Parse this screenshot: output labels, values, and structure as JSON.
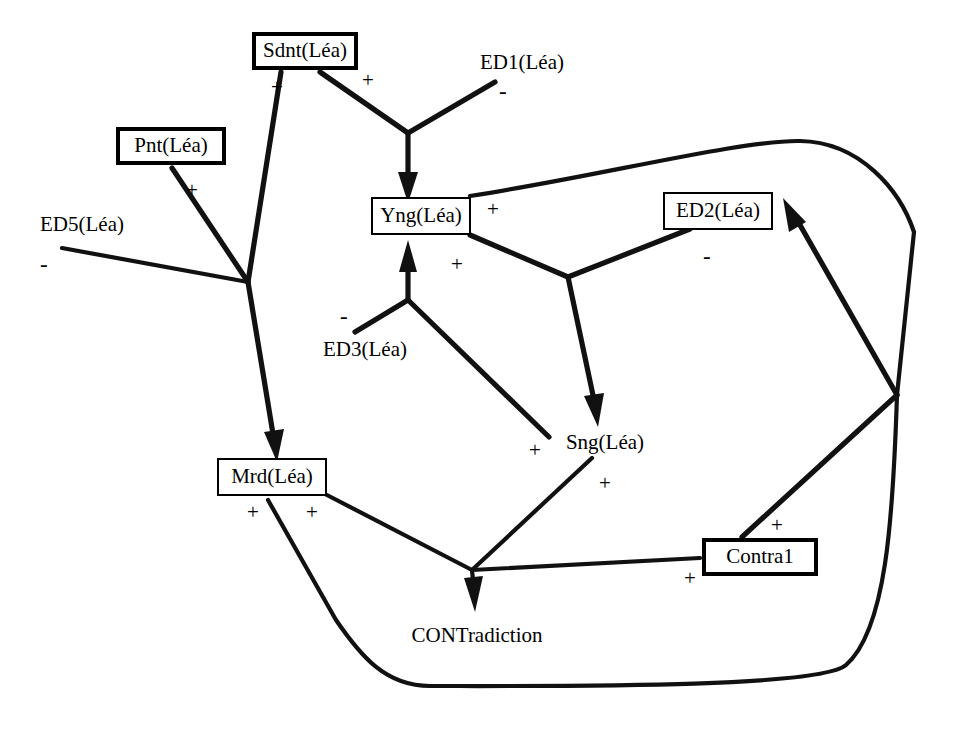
{
  "diagram": {
    "width": 953,
    "height": 729,
    "stroke_color": "#111111",
    "background": "#ffffff"
  },
  "nodes": [
    {
      "id": "sdnt",
      "label": "Sdnt(Léa)",
      "style": "boxed-heavy",
      "x": 252,
      "y": 32,
      "w": 106,
      "h": 38
    },
    {
      "id": "ed1",
      "label": "ED1(Léa)",
      "style": "plain",
      "x": 470,
      "y": 48,
      "w": 104,
      "h": 28
    },
    {
      "id": "pnt",
      "label": "Pnt(Léa)",
      "style": "boxed-heavy",
      "x": 116,
      "y": 127,
      "w": 110,
      "h": 38
    },
    {
      "id": "ed5",
      "label": "ED5(Léa)",
      "style": "plain",
      "x": 30,
      "y": 210,
      "w": 104,
      "h": 28
    },
    {
      "id": "yng",
      "label": "Yng(Léa)",
      "style": "boxed-light",
      "x": 371,
      "y": 197,
      "w": 100,
      "h": 38
    },
    {
      "id": "ed2",
      "label": "ED2(Léa)",
      "style": "boxed-light",
      "x": 663,
      "y": 192,
      "w": 110,
      "h": 38
    },
    {
      "id": "ed3",
      "label": "ED3(Léa)",
      "style": "plain",
      "x": 313,
      "y": 335,
      "w": 104,
      "h": 28
    },
    {
      "id": "sng",
      "label": "Sng(Léa)",
      "style": "plain",
      "x": 556,
      "y": 428,
      "w": 98,
      "h": 28
    },
    {
      "id": "mrd",
      "label": "Mrd(Léa)",
      "style": "boxed-light",
      "x": 217,
      "y": 458,
      "w": 110,
      "h": 38
    },
    {
      "id": "contra1",
      "label": "Contra1",
      "style": "boxed-heavy",
      "x": 702,
      "y": 538,
      "w": 116,
      "h": 38
    },
    {
      "id": "contradiction",
      "label": "CONTradiction",
      "style": "plain",
      "x": 401,
      "y": 621,
      "w": 152,
      "h": 28
    }
  ],
  "signs": [
    {
      "id": "s1",
      "sign": "+",
      "for": "sdnt-to-mrd-junction",
      "x": 271,
      "y": 77
    },
    {
      "id": "s2",
      "sign": "+",
      "for": "sdnt-to-yng",
      "x": 362,
      "y": 70
    },
    {
      "id": "s3",
      "sign": "-",
      "for": "ed1-to-yng",
      "x": 499,
      "y": 80
    },
    {
      "id": "s4",
      "sign": "+",
      "for": "pnt-to-mrd-junction",
      "x": 186,
      "y": 180
    },
    {
      "id": "s5",
      "sign": "-",
      "for": "ed5-to-mrd-junction",
      "x": 40,
      "y": 253
    },
    {
      "id": "s6",
      "sign": "+",
      "for": "yng-to-right-loop",
      "x": 487,
      "y": 199
    },
    {
      "id": "s7",
      "sign": "+",
      "for": "yng-to-sng-junction",
      "x": 451,
      "y": 254
    },
    {
      "id": "s8",
      "sign": "-",
      "for": "ed2-outgoing",
      "x": 703,
      "y": 245
    },
    {
      "id": "s9",
      "sign": "-",
      "for": "ed3-to-yng",
      "x": 340,
      "y": 305
    },
    {
      "id": "s10",
      "sign": "+",
      "for": "sng-to-yng",
      "x": 529,
      "y": 440
    },
    {
      "id": "s11",
      "sign": "+",
      "for": "sng-to-contradiction",
      "x": 599,
      "y": 473
    },
    {
      "id": "s12",
      "sign": "+",
      "for": "mrd-to-bottom-loop",
      "x": 247,
      "y": 502
    },
    {
      "id": "s13",
      "sign": "+",
      "for": "mrd-to-contradiction",
      "x": 306,
      "y": 502
    },
    {
      "id": "s14",
      "sign": "+",
      "for": "contra1-to-ed2",
      "x": 771,
      "y": 515
    },
    {
      "id": "s15",
      "sign": "+",
      "for": "contra1-to-contradiction",
      "x": 684,
      "y": 568
    }
  ],
  "edges": [
    {
      "id": "e-sdnt-yng",
      "from": "sdnt",
      "to": "yng",
      "sign": "+",
      "arrow": true,
      "desc": "Sdnt supports Yng"
    },
    {
      "id": "e-ed1-yng",
      "from": "ed1",
      "to": "yng",
      "sign": "-",
      "arrow": true,
      "desc": "ED1 attacks Yng"
    },
    {
      "id": "e-sdnt-mrd",
      "from": "sdnt",
      "to": "mrd",
      "sign": "+",
      "arrow": true,
      "desc": "Sdnt supports Mrd"
    },
    {
      "id": "e-pnt-mrd",
      "from": "pnt",
      "to": "mrd",
      "sign": "+",
      "arrow": true,
      "desc": "Pnt supports Mrd"
    },
    {
      "id": "e-ed5-mrd",
      "from": "ed5",
      "to": "mrd",
      "sign": "-",
      "arrow": true,
      "desc": "ED5 attacks Mrd"
    },
    {
      "id": "e-ed3-yng",
      "from": "ed3",
      "to": "yng",
      "sign": "-",
      "arrow": true,
      "desc": "ED3 attacks Yng"
    },
    {
      "id": "e-sng-yng",
      "from": "sng",
      "to": "yng",
      "sign": "+",
      "arrow": true,
      "desc": "Sng supports Yng"
    },
    {
      "id": "e-yng-sng",
      "from": "yng",
      "to": "sng",
      "sign": "+",
      "arrow": true,
      "desc": "Yng supports Sng"
    },
    {
      "id": "e-ed2-sng",
      "from": "ed2",
      "to": "sng",
      "sign": "-",
      "arrow": true,
      "desc": "ED2 attacks Sng"
    },
    {
      "id": "e-yng-loop",
      "from": "yng",
      "to": "loop-right",
      "sign": "+",
      "arrow": false,
      "desc": "Yng to right loop"
    },
    {
      "id": "e-contra1-ed2",
      "from": "contra1",
      "to": "ed2",
      "sign": "+",
      "arrow": true,
      "desc": "Contra1 supports ED2"
    },
    {
      "id": "e-contra1-contr",
      "from": "contra1",
      "to": "contradiction",
      "sign": "+",
      "arrow": true,
      "desc": "Contra1 supports CONTradiction"
    },
    {
      "id": "e-mrd-contr",
      "from": "mrd",
      "to": "contradiction",
      "sign": "+",
      "arrow": true,
      "desc": "Mrd supports CONTradiction"
    },
    {
      "id": "e-sng-contr",
      "from": "sng",
      "to": "contradiction",
      "sign": "+",
      "arrow": true,
      "desc": "Sng supports CONTradiction"
    },
    {
      "id": "e-mrd-loop",
      "from": "mrd",
      "to": "loop-bottom",
      "sign": "+",
      "arrow": false,
      "desc": "Mrd to bottom loop back to right junction"
    }
  ]
}
